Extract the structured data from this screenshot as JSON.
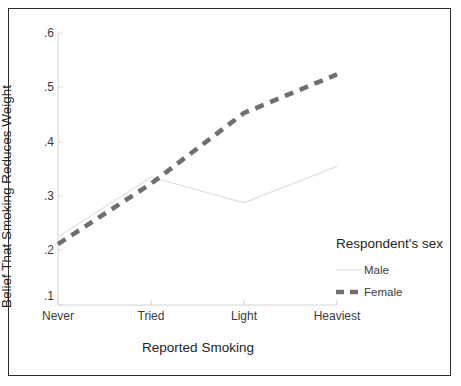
{
  "chart_data": {
    "type": "line",
    "title": "",
    "xlabel": "Reported Smoking",
    "ylabel": "Belief That Smoking Reduces Weight",
    "categories": [
      "Never",
      "Tried",
      "Light",
      "Heaviest"
    ],
    "ylim": [
      0.1,
      0.6
    ],
    "yticks": [
      ".6",
      ".5",
      ".4",
      ".3",
      ".2",
      ".1"
    ],
    "ytick_values": [
      0.6,
      0.5,
      0.4,
      0.3,
      0.2,
      0.1
    ],
    "grid": false,
    "legend_position": "right",
    "legend_title": "Respondent's sex",
    "series": [
      {
        "name": "Male",
        "style": "solid",
        "color": "#e2e2e2",
        "width": 1.3,
        "values": [
          0.225,
          0.335,
          0.288,
          0.355
        ]
      },
      {
        "name": "Female",
        "style": "dashed",
        "color": "#6f6f6f",
        "width": 4.6,
        "values": [
          0.212,
          0.323,
          0.453,
          0.524
        ]
      }
    ]
  },
  "axes": {
    "ylabel": "Belief That Smoking Reduces Weight",
    "xlabel": "Reported Smoking",
    "ytick_labels": [
      ".6",
      ".5",
      ".4",
      ".3",
      ".2",
      ".1"
    ],
    "xtick_labels": [
      "Never",
      "Tried",
      "Light",
      "Heaviest"
    ]
  },
  "legend": {
    "title": "Respondent's sex",
    "entries": [
      {
        "label": "Male",
        "swatch": "solid-line-swatch"
      },
      {
        "label": "Female",
        "swatch": "dashed-line-swatch"
      }
    ]
  }
}
